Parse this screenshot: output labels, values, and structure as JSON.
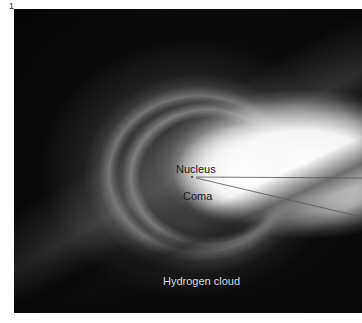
{
  "figure": {
    "number": "1",
    "labels": {
      "nucleus": "Nucleus",
      "coma": "Coma",
      "hydrogen_cloud": "Hydrogen cloud"
    },
    "colors": {
      "background": "#0b0b0b",
      "coma_bright": "#ffffff",
      "label_dark": "#222222",
      "label_light": "#d8d8d8",
      "leader_line": "#555555"
    }
  }
}
